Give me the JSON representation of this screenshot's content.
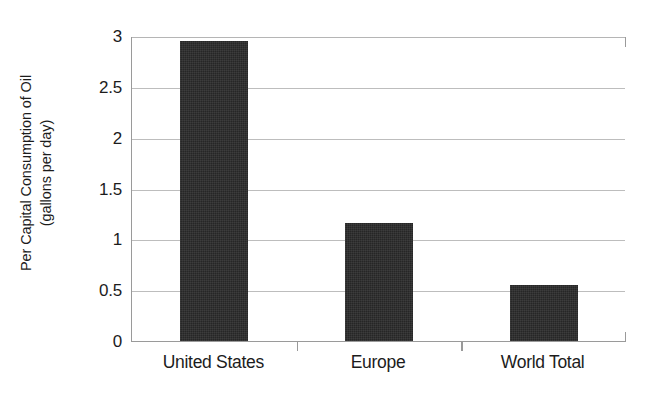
{
  "chart_data": {
    "type": "bar",
    "title": "",
    "subtitle": "",
    "xlabel": "",
    "ylabel_line1": "Per Capital Consumption of Oil",
    "ylabel_line2": "(gallons per day)",
    "ylabel": "Per Capital Consumption of Oil (gallons per day)",
    "categories": [
      "United States",
      "Europe",
      "World Total"
    ],
    "values": [
      2.95,
      1.16,
      0.55
    ],
    "ylim": [
      0,
      3
    ],
    "ytick_labels": [
      "0",
      "0.5",
      "1",
      "1.5",
      "2",
      "2.5",
      "3"
    ],
    "ytick_values": [
      0,
      0.5,
      1,
      1.5,
      2,
      2.5,
      3
    ],
    "grid": "horizontal",
    "legend": "none",
    "bar_color": "#262626",
    "gridline_color": "#bdbdbd",
    "axis_color": "#9a9a9a",
    "background_color": "#ffffff"
  }
}
